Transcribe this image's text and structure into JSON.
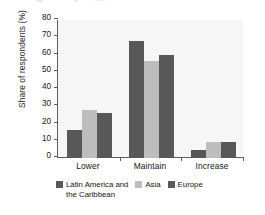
{
  "chart_data": {
    "type": "bar",
    "title": "",
    "xlabel": "",
    "ylabel": "Share of respondents (%)",
    "categories": [
      "Lower",
      "Maintain",
      "Increase"
    ],
    "series": [
      {
        "name": "Latin America and the Caribbean",
        "color": "#585858",
        "values": [
          16,
          68,
          4.5
        ]
      },
      {
        "name": "Asia",
        "color": "#bdbdbd",
        "values": [
          28,
          56,
          9.5
        ]
      },
      {
        "name": "Europe",
        "color": "#585858",
        "values": [
          26,
          60,
          9
        ]
      }
    ],
    "ylim": [
      0,
      80
    ],
    "yticks": [
      0,
      10,
      20,
      30,
      40,
      50,
      60,
      70,
      80
    ],
    "ytick_labels": [
      "0",
      "10",
      "20",
      "30",
      "40",
      "50",
      "60",
      "70",
      "80"
    ],
    "grid": false,
    "legend_position": "bottom"
  },
  "legend": {
    "entries": [
      {
        "label": "Latin America and",
        "label_continued": "the Caribbean"
      },
      {
        "label": "Asia"
      },
      {
        "label": "Europe"
      }
    ]
  },
  "colors": {
    "series_dark": "#585858",
    "series_light": "#bdbdbd",
    "axis": "#5c5c5c",
    "plot_background": "#f6f6f6",
    "text": "#141414"
  }
}
